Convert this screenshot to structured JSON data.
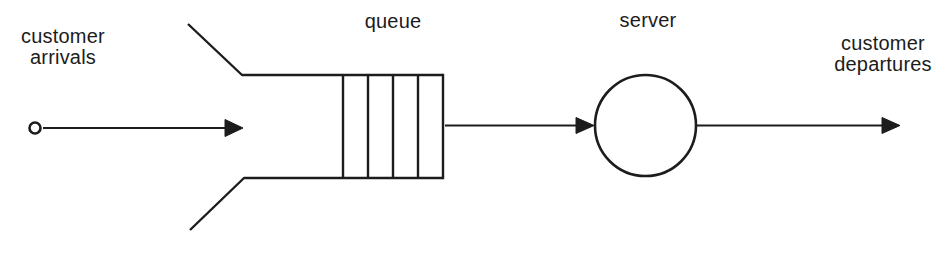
{
  "diagram": {
    "labels": {
      "arrivals": "customer\narrivals",
      "queue": "queue",
      "server": "server",
      "departures": "customer\ndepartures"
    },
    "colors": {
      "ink": "#1c1c1c",
      "background": "#ffffff"
    },
    "icons": {
      "arrival_source": "small-open-circle",
      "server_node": "large-open-circle",
      "flow": "right-arrow"
    }
  }
}
